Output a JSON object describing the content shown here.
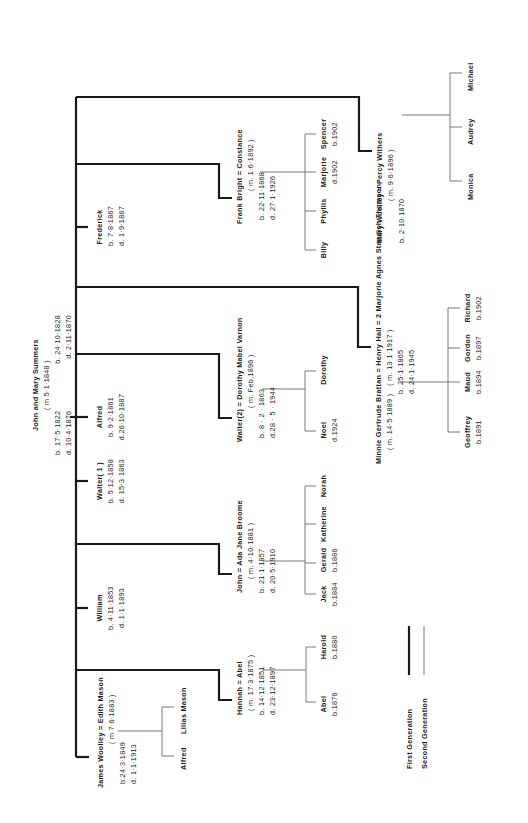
{
  "diagram": {
    "type": "family-tree",
    "orientation": "rotated-90-ccw",
    "colors": {
      "first_generation_line": "#1a1a1a",
      "second_generation_line": "#6a6a6a",
      "background": "#ffffff"
    }
  },
  "root": {
    "name": "John and Mary Summers",
    "marriage": "( m  5·1·1848 )",
    "john_born": "b. 17·5·1822",
    "john_died": "d.  10·4·1876",
    "mary_born": "b.  24·10·1828",
    "mary_died": "d.    2·11·1870"
  },
  "children": [
    {
      "id": "mary",
      "line1": "Mary Woolley = Percy  Withers",
      "line2": "( m. 9·6·1896 )",
      "line3": "b.  2·10·1870",
      "children": [
        "Monica",
        "Audrey",
        "Michael"
      ]
    },
    {
      "id": "frederick",
      "name": "Frederick",
      "born": "b. 7·8·1867",
      "died": "d. 1·9·1867"
    },
    {
      "id": "constance",
      "line1": "Frank  Bright = Constance",
      "line2": "( m. 1·6·1892 )",
      "line3": "b.  22·11·1868",
      "line4": "d.  27·1·1926",
      "children": [
        {
          "name": "Billy",
          "note": ""
        },
        {
          "name": "Phyllis",
          "note": ""
        },
        {
          "name": "Marjorie",
          "note": "d.1902"
        },
        {
          "name": "Spencer",
          "note": "b.1902"
        }
      ]
    },
    {
      "id": "henry",
      "line1": "Minnie Gertrude Brattan = Henry Hall = 2  Marjorie Agnes Standish Thomson",
      "marriage1": "( m. 14·5·1889 )",
      "marriage2": "( m. 13·1·1917 )",
      "born": "b. 25·1·1865",
      "died": "d. 24·1·1945",
      "children": [
        {
          "name": "Geoffrey",
          "note": "b.1891"
        },
        {
          "name": "Maud",
          "note": "b.1894"
        },
        {
          "name": "Gordon",
          "note": "b.1897"
        },
        {
          "name": "Richard",
          "note": "b.1902"
        }
      ]
    },
    {
      "id": "walter2",
      "line1": "Walter(2) = Dorothy Mabel Varnon",
      "line2": "( m. Feb,1896 )",
      "line3": "b.  8 · 2 · 1863",
      "line4": "d.28 · 5 · 1944",
      "children": [
        {
          "name": "Noel",
          "note": "d.1924"
        },
        {
          "name": "Dorothy",
          "note": ""
        }
      ]
    },
    {
      "id": "alfred",
      "name": "Alfred",
      "born": "b. 9·2·1861",
      "died": "d.26·10·1887"
    },
    {
      "id": "walter1",
      "name": "Walter( 1 )",
      "born": "b. 5·12·1858",
      "died": "d. 15·3·1863"
    },
    {
      "id": "john",
      "line1": "John = Ada Jane Broome",
      "line2": "( m. 4·10·1881 )",
      "line3": "b. 21·1·1857",
      "line4": "d. 20·5·1910",
      "children": [
        {
          "name": "Jack",
          "note": "b.1884"
        },
        {
          "name": "Gerald",
          "note": "b.1886"
        },
        {
          "name": "Katherine",
          "note": ""
        },
        {
          "name": "Norah",
          "note": ""
        }
      ]
    },
    {
      "id": "william",
      "name": "William",
      "born": "b. 4·11·1853",
      "died": "d. 1·1·1893"
    },
    {
      "id": "hannah",
      "line1": "Hannah = Abel",
      "line2": "( m. 17·3·1875 )",
      "line3": "b. 14·12·1851",
      "line4": "d. 23·12·1897",
      "children": [
        {
          "name": "Abel",
          "note": "b.1876"
        },
        {
          "name": "Harold",
          "note": "b.1880"
        }
      ]
    },
    {
      "id": "james",
      "line1": "James Woolley = Edith Mason",
      "line2": "( m 7·6·1883 )",
      "line3": "b.24·3·1849",
      "line4": "d.  1·1·1913",
      "children": [
        {
          "name": "Alfred",
          "note": ""
        },
        {
          "name": "Lilias Mason",
          "note": ""
        }
      ]
    }
  ],
  "legend": {
    "first_generation": "First  Generation",
    "second_generation": "Second  Generation"
  }
}
